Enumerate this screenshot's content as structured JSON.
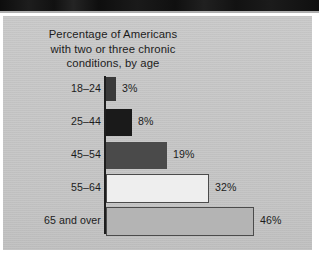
{
  "figure": {
    "title_lines": [
      "Percentage of Americans",
      "with two or three chronic",
      "conditions, by age"
    ],
    "panel_color": "#c6c6c6",
    "text_color": "#1c1c1c",
    "axis_color": "#1e1e1e"
  },
  "chart_data": {
    "type": "bar",
    "orientation": "horizontal",
    "title": "Percentage of Americans with two or three chronic conditions, by age",
    "xlabel": "",
    "ylabel": "",
    "categories": [
      "18–24",
      "25–44",
      "45–54",
      "55–64",
      "65 and over"
    ],
    "values": [
      3,
      8,
      19,
      32,
      46
    ],
    "data_labels": [
      "3%",
      "8%",
      "19%",
      "32%",
      "46%"
    ],
    "unit": "percent",
    "xlim": [
      0,
      46
    ],
    "grid": false,
    "legend": null,
    "bar_colors": [
      "#3a3a3a",
      "#1a1a1a",
      "#4a4a4a",
      "#eeeeee",
      "#b4b4b4"
    ],
    "bar_outlined": [
      false,
      false,
      false,
      true,
      true
    ],
    "px_per_unit": 3.21
  }
}
